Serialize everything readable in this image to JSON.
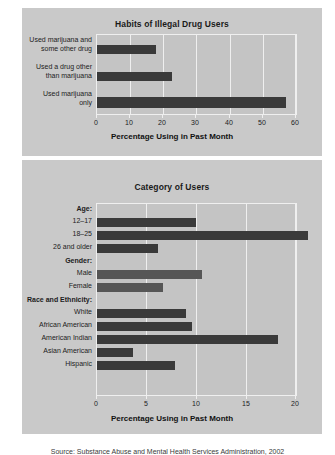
{
  "figure": {
    "caption": "Source: Substance Abuse and Mental Health Services Administration, 2002"
  },
  "chart_data": [
    {
      "type": "bar",
      "orientation": "horizontal",
      "title": "Habits of Illegal Drug Users",
      "xlabel": "Percentage Using in Past Month",
      "ylabel": "",
      "xlim": [
        0,
        60
      ],
      "xticks": [
        0,
        10,
        20,
        30,
        40,
        50,
        60
      ],
      "grid": true,
      "legend": "none",
      "categories": [
        "Used marijuana and some other drug",
        "Used a drug other than marijuana",
        "Used marijuana only"
      ],
      "category_lines": [
        [
          "Used marijuana and",
          "some other drug"
        ],
        [
          "Used a drug other",
          "than marijuana"
        ],
        [
          "Used marijuana",
          "only"
        ]
      ],
      "values": [
        17.8,
        22.6,
        57.0
      ],
      "bar_color": "#3a3a3a"
    },
    {
      "type": "bar",
      "orientation": "horizontal",
      "title": "Category of Users",
      "xlabel": "Percentage Using in Past Month",
      "ylabel": "",
      "xlim": [
        0,
        20
      ],
      "xticks": [
        0,
        5,
        10,
        15,
        20
      ],
      "grid": true,
      "legend": "none",
      "groups": [
        {
          "header": "Age:",
          "categories": [
            "12–17",
            "18–25",
            "26 and older"
          ],
          "values": [
            9.9,
            21.2,
            6.1
          ],
          "bar_color": "#3a3a3a"
        },
        {
          "header": "Gender:",
          "categories": [
            "Male",
            "Female"
          ],
          "values": [
            10.6,
            6.6
          ],
          "bar_color": "#565656"
        },
        {
          "header": "Race and Ethnicity:",
          "categories": [
            "White",
            "African American",
            "American Indian",
            "Asian American",
            "Hispanic"
          ],
          "values": [
            8.9,
            9.5,
            18.2,
            3.6,
            7.8
          ],
          "bar_color": "#3a3a3a"
        }
      ]
    }
  ]
}
